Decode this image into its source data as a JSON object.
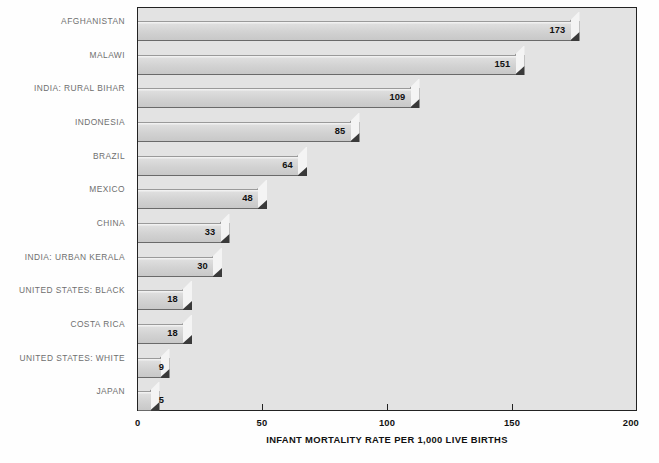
{
  "chart_data": {
    "type": "bar",
    "orientation": "horizontal",
    "title": "",
    "subtitle": "",
    "xlabel": "INFANT MORTALITY RATE PER 1,000 LIVE BIRTHS",
    "ylabel": "",
    "xlim": [
      0,
      200
    ],
    "xticks": [
      "0",
      "50",
      "100",
      "150",
      "200"
    ],
    "xtick_values": [
      0,
      50,
      100,
      150,
      200
    ],
    "grid": false,
    "legend": null,
    "categories": [
      "AFGHANISTAN",
      "MALAWI",
      "INDIA: RURAL BIHAR",
      "INDONESIA",
      "BRAZIL",
      "MEXICO",
      "CHINA",
      "INDIA: URBAN KERALA",
      "UNITED STATES: BLACK",
      "COSTA RICA",
      "UNITED STATES: WHITE",
      "JAPAN"
    ],
    "values": [
      173,
      151,
      109,
      85,
      64,
      48,
      33,
      30,
      18,
      18,
      9,
      5
    ],
    "value_labels": [
      "173",
      "151",
      "109",
      "85",
      "64",
      "48",
      "33",
      "30",
      "18",
      "18",
      "9",
      "5"
    ],
    "colors": {
      "plot_background": "#e3e3e3",
      "figure_background": "#fefefe",
      "bar_face": "#d2d2d2",
      "bar_cap": "#f4f4f4",
      "bar_shadow": "#3a3a3a",
      "axis": "#222222",
      "category_label": "#6f6f6f",
      "value_label": "#111111"
    }
  }
}
